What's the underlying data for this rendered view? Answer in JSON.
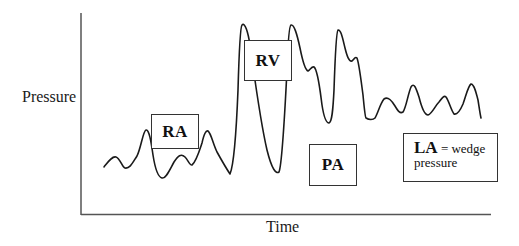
{
  "diagram": {
    "title": "",
    "axes": {
      "y_label": "Pressure",
      "x_label": "Time"
    },
    "labels": {
      "ra": "RA",
      "rv": "RV",
      "pa": "PA",
      "la_bold": "LA",
      "la_rest": " = wedge",
      "la_line2": "pressure"
    },
    "colors": {
      "line": "#1a1a1a",
      "axis": "#555555",
      "box_border": "#333333",
      "background": "#ffffff"
    },
    "waveform_segments": [
      {
        "chamber": "RA",
        "description": "low-amplitude oscillating right atrial pressure trace"
      },
      {
        "chamber": "RV",
        "description": "tall spikes with deep drops to baseline"
      },
      {
        "chamber": "PA",
        "description": "tall peaks with dicrotic notch, diastolic level elevated"
      },
      {
        "chamber": "LA",
        "description": "wedge pressure: moderate oscillations at lower level"
      }
    ]
  }
}
